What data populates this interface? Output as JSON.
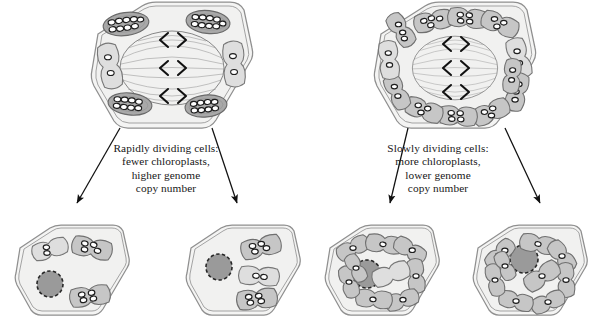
{
  "figure": {
    "domain": "biological-diagram",
    "background_color": "#ffffff",
    "width": 608,
    "height": 332
  },
  "palette": {
    "cell_wall_stroke": "#8f8f8f",
    "cytoplasm_fill": "#f2f2f1",
    "chloroplast_dark_fill": "#a9a9a9",
    "chloroplast_light_fill": "#dcdcdc",
    "chloroplast_stroke": "#6e6e6e",
    "nucleoid_fill": "#ffffff",
    "nucleoid_stroke": "#1f1f1f",
    "nucleus_fill": "#9a9a9a",
    "nucleus_stroke": "#262626",
    "spindle_stroke": "#7c7c7c",
    "chromosome_stroke": "#111111",
    "arrow_color": "#111111",
    "text_color": "#171717"
  },
  "labels": {
    "left": {
      "id": "rapidly-dividing-label",
      "lines": [
        "Rapidly dividing cells:",
        "fewer chloroplasts,",
        "higher genome",
        "copy number"
      ],
      "text": "Rapidly dividing cells:\nfewer chloroplasts,\nhigher genome\ncopy number"
    },
    "right": {
      "id": "slowly-dividing-label",
      "lines": [
        "Slowly dividing cells:",
        "more chloroplasts,",
        "lower genome",
        "copy number"
      ],
      "text": "Slowly dividing cells:\nmore chloroplasts,\nlower genome\ncopy number"
    }
  },
  "cells": {
    "parent_left": {
      "name": "rapidly-dividing-parent-cell",
      "stage": "mitosis",
      "chloroplast_count": 6,
      "nucleoids_per_chloroplast": "8-10",
      "genome_copy_number": "high",
      "spindle": {
        "present": true,
        "chromosome_pairs": 3,
        "chromosome_glyph": "< >"
      },
      "center": [
        172,
        68
      ]
    },
    "parent_right": {
      "name": "slowly-dividing-parent-cell",
      "stage": "mitosis",
      "chloroplast_count": 12,
      "nucleoids_per_chloroplast": "3-4",
      "genome_copy_number": "low",
      "spindle": {
        "present": true,
        "chromosome_pairs": 3,
        "chromosome_glyph": "< >"
      },
      "center": [
        455,
        68
      ]
    },
    "daughters": [
      {
        "name": "rapidly-dividing-daughter-cell-1",
        "chloroplast_count": 3,
        "nucleoids_per_chloroplast": "2-3",
        "nucleus": true,
        "center": [
          72,
          270
        ]
      },
      {
        "name": "rapidly-dividing-daughter-cell-2",
        "chloroplast_count": 3,
        "nucleoids_per_chloroplast": "2-3",
        "nucleus": true,
        "center": [
          243,
          270
        ]
      },
      {
        "name": "slowly-dividing-daughter-cell-1",
        "chloroplast_count": 9,
        "nucleoids_per_chloroplast": "1",
        "nucleus": true,
        "center": [
          382,
          270
        ]
      },
      {
        "name": "slowly-dividing-daughter-cell-2",
        "chloroplast_count": 9,
        "nucleoids_per_chloroplast": "1",
        "nucleus": true,
        "center": [
          530,
          270
        ]
      }
    ]
  },
  "arrows": [
    {
      "name": "arrow-left-outer",
      "from": [
        120,
        128
      ],
      "to": [
        75,
        205
      ]
    },
    {
      "name": "arrow-left-inner",
      "from": [
        212,
        128
      ],
      "to": [
        238,
        205
      ]
    },
    {
      "name": "arrow-right-inner",
      "from": [
        408,
        128
      ],
      "to": [
        390,
        205
      ]
    },
    {
      "name": "arrow-right-outer",
      "from": [
        505,
        128
      ],
      "to": [
        540,
        205
      ]
    }
  ]
}
